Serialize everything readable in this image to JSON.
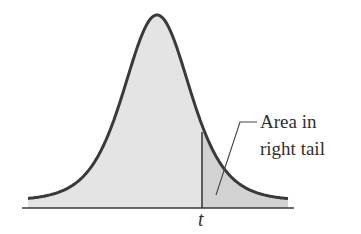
{
  "figure": {
    "type": "t-distribution-right-tail",
    "annotation_line1": "Area in",
    "annotation_line2": "right tail",
    "x_marker_label": "t"
  },
  "colors": {
    "curve": "#3a3a3a",
    "body_fill": "#e4e4e4",
    "tail_fill": "#d2d2d2",
    "axis": "#3a3a3a",
    "text": "#2f2f2f"
  }
}
